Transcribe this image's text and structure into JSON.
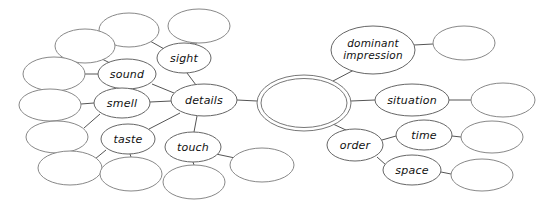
{
  "diagram": {
    "background_color": "#ffffff",
    "edge_color": "#555555",
    "node_stroke_color": "#666666",
    "node_fill_color": "#ffffff",
    "label_color": "#111111",
    "center": {
      "name": "center-topic",
      "label": "",
      "double_outline": true,
      "cx": 304,
      "cy": 103,
      "rx": 47,
      "ry": 28
    },
    "nodes": [
      {
        "id": "details",
        "label": "details",
        "cx": 204,
        "cy": 100,
        "rx": 33,
        "ry": 16,
        "labeled": true
      },
      {
        "id": "sight",
        "label": "sight",
        "cx": 184,
        "cy": 58,
        "rx": 27,
        "ry": 15,
        "labeled": true
      },
      {
        "id": "sound",
        "label": "sound",
        "cx": 127,
        "cy": 74,
        "rx": 29,
        "ry": 15,
        "labeled": true
      },
      {
        "id": "smell",
        "label": "smell",
        "cx": 122,
        "cy": 103,
        "rx": 28,
        "ry": 15,
        "labeled": true
      },
      {
        "id": "taste",
        "label": "taste",
        "cx": 128,
        "cy": 139,
        "rx": 27,
        "ry": 15,
        "labeled": true
      },
      {
        "id": "touch",
        "label": "touch",
        "cx": 193,
        "cy": 147,
        "rx": 28,
        "ry": 15,
        "labeled": true
      },
      {
        "id": "dominant-impression",
        "label": "dominant impression",
        "line1": "dominant",
        "line2": "impression",
        "cx": 373,
        "cy": 50,
        "rx": 42,
        "ry": 24,
        "labeled": true
      },
      {
        "id": "situation",
        "label": "situation",
        "cx": 412,
        "cy": 100,
        "rx": 37,
        "ry": 16,
        "labeled": true
      },
      {
        "id": "order",
        "label": "order",
        "cx": 355,
        "cy": 145,
        "rx": 28,
        "ry": 16,
        "labeled": true
      },
      {
        "id": "time",
        "label": "time",
        "cx": 424,
        "cy": 135,
        "rx": 28,
        "ry": 15,
        "labeled": true
      },
      {
        "id": "space",
        "label": "space",
        "cx": 412,
        "cy": 170,
        "rx": 29,
        "ry": 15,
        "labeled": true
      }
    ],
    "blank_nodes": [
      {
        "id": "blank-sight-left",
        "cx": 129,
        "cy": 30,
        "rx": 30,
        "ry": 17
      },
      {
        "id": "blank-sight-right",
        "cx": 199,
        "cy": 26,
        "rx": 31,
        "ry": 17
      },
      {
        "id": "blank-sound-upper",
        "cx": 85,
        "cy": 46,
        "rx": 30,
        "ry": 17
      },
      {
        "id": "blank-sound-left",
        "cx": 54,
        "cy": 74,
        "rx": 31,
        "ry": 17
      },
      {
        "id": "blank-smell-left",
        "cx": 50,
        "cy": 105,
        "rx": 31,
        "ry": 16
      },
      {
        "id": "blank-taste-left",
        "cx": 57,
        "cy": 137,
        "rx": 31,
        "ry": 16
      },
      {
        "id": "blank-taste-lower",
        "cx": 70,
        "cy": 168,
        "rx": 32,
        "ry": 17
      },
      {
        "id": "blank-taste-below",
        "cx": 131,
        "cy": 174,
        "rx": 31,
        "ry": 17
      },
      {
        "id": "blank-touch-below",
        "cx": 194,
        "cy": 182,
        "rx": 31,
        "ry": 17
      },
      {
        "id": "blank-touch-right",
        "cx": 262,
        "cy": 165,
        "rx": 32,
        "ry": 17
      },
      {
        "id": "blank-dominant",
        "cx": 464,
        "cy": 43,
        "rx": 31,
        "ry": 17
      },
      {
        "id": "blank-situation",
        "cx": 503,
        "cy": 100,
        "rx": 32,
        "ry": 17
      },
      {
        "id": "blank-time",
        "cx": 492,
        "cy": 137,
        "rx": 31,
        "ry": 16
      },
      {
        "id": "blank-space",
        "cx": 482,
        "cy": 175,
        "rx": 31,
        "ry": 16
      }
    ],
    "edges": [
      {
        "from": "center-topic",
        "to": "details",
        "x1": 257,
        "y1": 101,
        "x2": 237,
        "y2": 100
      },
      {
        "from": "center-topic",
        "to": "dominant-impression",
        "x1": 333,
        "y1": 81,
        "x2": 354,
        "y2": 70
      },
      {
        "from": "center-topic",
        "to": "situation",
        "x1": 351,
        "y1": 101,
        "x2": 375,
        "y2": 100
      },
      {
        "from": "center-topic",
        "to": "order",
        "x1": 333,
        "y1": 124,
        "x2": 348,
        "y2": 131
      },
      {
        "from": "details",
        "to": "sight",
        "x1": 196,
        "y1": 85,
        "x2": 187,
        "y2": 73
      },
      {
        "from": "details",
        "to": "sound",
        "x1": 174,
        "y1": 93,
        "x2": 152,
        "y2": 84
      },
      {
        "from": "details",
        "to": "smell",
        "x1": 171,
        "y1": 101,
        "x2": 150,
        "y2": 102
      },
      {
        "from": "details",
        "to": "taste",
        "x1": 180,
        "y1": 113,
        "x2": 149,
        "y2": 129
      },
      {
        "from": "details",
        "to": "touch",
        "x1": 197,
        "y1": 116,
        "x2": 194,
        "y2": 132
      },
      {
        "from": "sight",
        "to": "blank-sight-left",
        "x1": 166,
        "y1": 50,
        "x2": 150,
        "y2": 41
      },
      {
        "from": "sight",
        "to": "blank-sight-right",
        "x1": 191,
        "y1": 43,
        "x2": 197,
        "y2": 43
      },
      {
        "from": "sound",
        "to": "blank-sound-upper",
        "x1": 110,
        "y1": 63,
        "x2": 100,
        "y2": 58
      },
      {
        "from": "sound",
        "to": "blank-sound-left",
        "x1": 98,
        "y1": 74,
        "x2": 85,
        "y2": 74
      },
      {
        "from": "smell",
        "to": "blank-smell-left",
        "x1": 94,
        "y1": 103,
        "x2": 81,
        "y2": 104
      },
      {
        "from": "smell",
        "to": "blank-taste-left",
        "x1": 100,
        "y1": 114,
        "x2": 84,
        "y2": 128
      },
      {
        "from": "taste",
        "to": "blank-taste-lower",
        "x1": 106,
        "y1": 150,
        "x2": 95,
        "y2": 159
      },
      {
        "from": "taste",
        "to": "blank-taste-below",
        "x1": 130,
        "y1": 154,
        "x2": 131,
        "y2": 157
      },
      {
        "from": "touch",
        "to": "blank-touch-below",
        "x1": 193,
        "y1": 162,
        "x2": 194,
        "y2": 165
      },
      {
        "from": "touch",
        "to": "blank-touch-right",
        "x1": 216,
        "y1": 154,
        "x2": 235,
        "y2": 158
      },
      {
        "from": "dominant-impression",
        "to": "blank-dominant",
        "x1": 414,
        "y1": 45,
        "x2": 433,
        "y2": 44
      },
      {
        "from": "situation",
        "to": "blank-situation",
        "x1": 449,
        "y1": 100,
        "x2": 471,
        "y2": 100
      },
      {
        "from": "order",
        "to": "time",
        "x1": 382,
        "y1": 140,
        "x2": 396,
        "y2": 136
      },
      {
        "from": "order",
        "to": "space",
        "x1": 377,
        "y1": 157,
        "x2": 386,
        "y2": 165
      },
      {
        "from": "time",
        "to": "blank-time",
        "x1": 452,
        "y1": 136,
        "x2": 461,
        "y2": 137
      },
      {
        "from": "space",
        "to": "blank-space",
        "x1": 441,
        "y1": 172,
        "x2": 451,
        "y2": 174
      }
    ]
  }
}
